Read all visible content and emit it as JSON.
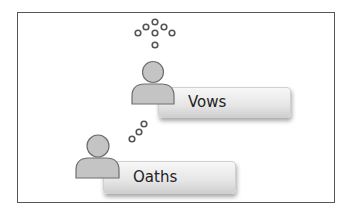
{
  "diagram": {
    "boxes": [
      {
        "id": "vows",
        "label": "Vows"
      },
      {
        "id": "oaths",
        "label": "Oaths"
      }
    ],
    "icons": {
      "person_top": "person-icon",
      "person_bottom": "person-icon",
      "thought_dots_top": "thought-dots-icon",
      "thought_dots_bottom": "thought-dots-icon"
    },
    "colors": {
      "frame_border": "#555555",
      "person_fill": "#c4c4c4",
      "person_stroke": "#6e6e6e",
      "dot_stroke": "#555555",
      "text": "#222222"
    }
  }
}
